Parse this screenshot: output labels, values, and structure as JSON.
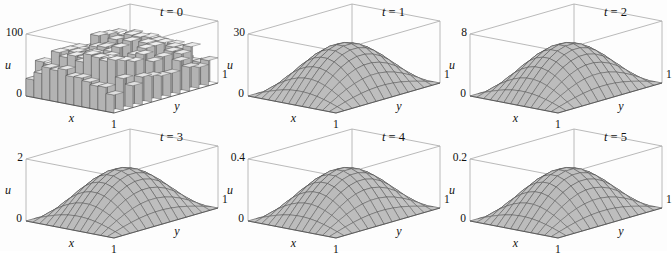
{
  "figure": {
    "title": "",
    "background": "#fdfdfd",
    "rows": 2,
    "cols": 3
  },
  "chart_data": {
    "type": "surface",
    "title": "",
    "xlabel": "x",
    "ylabel": "y",
    "zlabel": "u",
    "xlim": [
      0,
      1
    ],
    "ylim": [
      0,
      1
    ],
    "grid": true,
    "legend": "none",
    "surface_style": {
      "mesh_color": "#3a3a3a",
      "fill_light": "#e6e6e6",
      "fill_mid": "#c2c2c2",
      "fill_dark": "#8f8f8f",
      "box_color": "#999999"
    },
    "panels": [
      {
        "id": "panel-t0",
        "time_label": "t = 0",
        "t": 0,
        "zmax": 100,
        "zmax_label": "100",
        "zmin_label": "0",
        "x_tick_label": "1",
        "y_tick_label": "1",
        "x_axis_label": "x",
        "y_axis_label": "y",
        "z_axis_label": "u",
        "shape": "rough",
        "peak_value": 100,
        "note": "Random blocky initial condition, piecewise-constant cells at full amplitude"
      },
      {
        "id": "panel-t1",
        "time_label": "t = 1",
        "t": 1,
        "zmax": 30,
        "zmax_label": "30",
        "zmin_label": "0",
        "x_tick_label": "1",
        "y_tick_label": "1",
        "x_axis_label": "x",
        "y_axis_label": "y",
        "z_axis_label": "u",
        "shape": "smooth",
        "peak_value": 30,
        "note": "Single smooth hump, amplitude about 30"
      },
      {
        "id": "panel-t2",
        "time_label": "t = 2",
        "t": 2,
        "zmax": 8,
        "zmax_label": "8",
        "zmin_label": "0",
        "x_tick_label": "1",
        "y_tick_label": "1",
        "x_axis_label": "x",
        "y_axis_label": "y",
        "z_axis_label": "u",
        "shape": "smooth",
        "peak_value": 8,
        "note": "Hump amplitude about 8"
      },
      {
        "id": "panel-t3",
        "time_label": "t = 3",
        "t": 3,
        "zmax": 2,
        "zmax_label": "2",
        "zmin_label": "0",
        "x_tick_label": "1",
        "y_tick_label": "1",
        "x_axis_label": "x",
        "y_axis_label": "y",
        "z_axis_label": "u",
        "shape": "smooth",
        "peak_value": 2,
        "note": "Hump amplitude about 2"
      },
      {
        "id": "panel-t4",
        "time_label": "t = 4",
        "t": 4,
        "zmax": 0.4,
        "zmax_label": "0.4",
        "zmin_label": "0",
        "x_tick_label": "1",
        "y_tick_label": "1",
        "x_axis_label": "x",
        "y_axis_label": "y",
        "z_axis_label": "u",
        "shape": "smooth",
        "peak_value": 0.4,
        "note": "Hump amplitude about 0.4"
      },
      {
        "id": "panel-t5",
        "time_label": "t = 5",
        "t": 5,
        "zmax": 0.2,
        "zmax_label": "0.2",
        "zmin_label": "0",
        "x_tick_label": "1",
        "y_tick_label": "1",
        "x_axis_label": "x",
        "y_axis_label": "y",
        "z_axis_label": "u",
        "shape": "smooth",
        "peak_value": 0.2,
        "note": "Hump amplitude about 0.2"
      }
    ]
  }
}
